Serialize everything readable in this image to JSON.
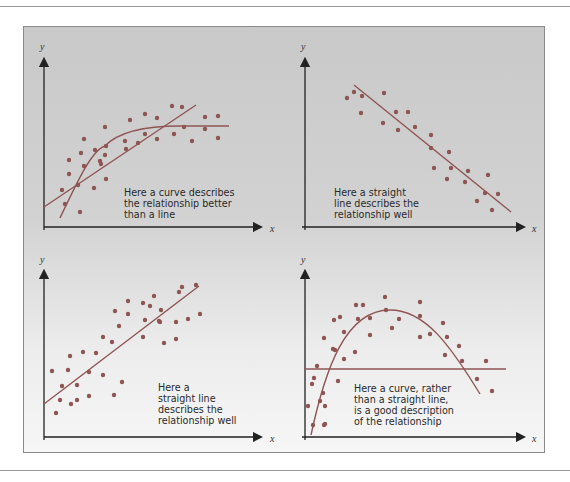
{
  "chart_data": [
    {
      "type": "scatter",
      "panel": "top-left",
      "xlabel": "x",
      "ylabel": "y",
      "annotation": "Here a curve describes the relationship better than a line",
      "fits": [
        "curve (saturating)",
        "straight line"
      ],
      "points": [
        [
          62,
          190
        ],
        [
          65,
          204
        ],
        [
          69,
          160
        ],
        [
          69,
          174
        ],
        [
          78,
          185
        ],
        [
          81,
          153
        ],
        [
          80,
          212
        ],
        [
          84,
          139
        ],
        [
          84,
          166
        ],
        [
          94,
          188
        ],
        [
          95,
          150
        ],
        [
          101,
          164
        ],
        [
          100,
          161
        ],
        [
          105,
          127
        ],
        [
          105,
          155
        ],
        [
          106,
          179
        ],
        [
          106,
          146
        ],
        [
          125,
          141
        ],
        [
          126,
          149
        ],
        [
          130,
          120
        ],
        [
          138,
          143
        ],
        [
          145,
          114
        ],
        [
          145,
          134
        ],
        [
          157,
          118
        ],
        [
          157,
          139
        ],
        [
          172,
          106
        ],
        [
          174,
          134
        ],
        [
          182,
          107
        ],
        [
          184,
          127
        ],
        [
          192,
          141
        ],
        [
          205,
          117
        ],
        [
          205,
          129
        ],
        [
          218,
          116
        ],
        [
          218,
          138
        ]
      ],
      "labels_annotation": [
        "Here a curve describes",
        "the relationship better",
        "than a line"
      ]
    },
    {
      "type": "scatter",
      "panel": "top-right",
      "xlabel": "x",
      "ylabel": "y",
      "annotation": "Here a straight line describes the relationship well",
      "fits": [
        "straight line (negative slope)"
      ],
      "points": [
        [
          347,
          98
        ],
        [
          354,
          92
        ],
        [
          362,
          96
        ],
        [
          361,
          113
        ],
        [
          383,
          123
        ],
        [
          384,
          93
        ],
        [
          396,
          112
        ],
        [
          398,
          130
        ],
        [
          408,
          112
        ],
        [
          415,
          127
        ],
        [
          431,
          135
        ],
        [
          431,
          148
        ],
        [
          434,
          168
        ],
        [
          449,
          152
        ],
        [
          451,
          168
        ],
        [
          447,
          179
        ],
        [
          468,
          171
        ],
        [
          465,
          182
        ],
        [
          488,
          175
        ],
        [
          477,
          201
        ],
        [
          485,
          193
        ],
        [
          492,
          210
        ],
        [
          498,
          194
        ]
      ],
      "labels_annotation": [
        "Here a straight",
        "line describes the",
        "relationship well"
      ]
    },
    {
      "type": "scatter",
      "panel": "bottom-left",
      "xlabel": "x",
      "ylabel": "y",
      "annotation": "Here a straight line describes the relationship well",
      "fits": [
        "straight line (positive slope)"
      ],
      "points": [
        [
          56,
          413
        ],
        [
          60,
          400
        ],
        [
          52,
          371
        ],
        [
          62,
          386
        ],
        [
          68,
          370
        ],
        [
          70,
          356
        ],
        [
          71,
          404
        ],
        [
          77,
          385
        ],
        [
          77,
          400
        ],
        [
          83,
          352
        ],
        [
          89,
          372
        ],
        [
          96,
          353
        ],
        [
          89,
          396
        ],
        [
          103,
          375
        ],
        [
          103,
          337
        ],
        [
          112,
          342
        ],
        [
          115,
          311
        ],
        [
          114,
          395
        ],
        [
          119,
          326
        ],
        [
          122,
          382
        ],
        [
          128,
          314
        ],
        [
          128,
          301
        ],
        [
          143,
          337
        ],
        [
          145,
          320
        ],
        [
          143,
          303
        ],
        [
          150,
          306
        ],
        [
          154,
          296
        ],
        [
          159,
          321
        ],
        [
          161,
          310
        ],
        [
          164,
          343
        ],
        [
          160,
          322
        ],
        [
          176,
          339
        ],
        [
          176,
          322
        ],
        [
          179,
          292
        ],
        [
          182,
          287
        ],
        [
          188,
          319
        ],
        [
          196,
          285
        ],
        [
          200,
          314
        ]
      ],
      "labels_annotation": [
        "Here a",
        "straight line",
        "describes the",
        "relationship well"
      ]
    },
    {
      "type": "scatter",
      "panel": "bottom-right",
      "xlabel": "x",
      "ylabel": "y",
      "annotation": "Here a curve, rather than a straight line, is a good description of the relationship",
      "fits": [
        "curve (inverted U)",
        "horizontal straight line"
      ],
      "points": [
        [
          308,
          406
        ],
        [
          312,
          384
        ],
        [
          313,
          425
        ],
        [
          314,
          378
        ],
        [
          317,
          366
        ],
        [
          320,
          401
        ],
        [
          323,
          393
        ],
        [
          324,
          338
        ],
        [
          324,
          425
        ],
        [
          325,
          406
        ],
        [
          325,
          424
        ],
        [
          333,
          349
        ],
        [
          335,
          350
        ],
        [
          334,
          320
        ],
        [
          338,
          381
        ],
        [
          340,
          317
        ],
        [
          344,
          332
        ],
        [
          344,
          359
        ],
        [
          355,
          352
        ],
        [
          356,
          305
        ],
        [
          358,
          319
        ],
        [
          363,
          305
        ],
        [
          370,
          318
        ],
        [
          370,
          335
        ],
        [
          385,
          297
        ],
        [
          386,
          310
        ],
        [
          392,
          328
        ],
        [
          399,
          319
        ],
        [
          420,
          337
        ],
        [
          420,
          302
        ],
        [
          420,
          316
        ],
        [
          430,
          334
        ],
        [
          443,
          323
        ],
        [
          445,
          355
        ],
        [
          447,
          337
        ],
        [
          459,
          346
        ],
        [
          462,
          361
        ],
        [
          477,
          379
        ],
        [
          486,
          361
        ],
        [
          492,
          391
        ]
      ],
      "labels_annotation": [
        "Here a curve, rather",
        "than a straight line,",
        "is a good description",
        "of the relationship"
      ]
    }
  ],
  "figure": {
    "panels": [
      {
        "name": "top-left",
        "y_label": "y",
        "x_label": "x",
        "caption": [
          "Here a curve describes",
          "the relationship better",
          "than a line"
        ]
      },
      {
        "name": "top-right",
        "y_label": "y",
        "x_label": "x",
        "caption": [
          "Here a straight",
          "line describes the",
          "relationship well"
        ]
      },
      {
        "name": "bottom-left",
        "y_label": "y",
        "x_label": "x",
        "caption": [
          "Here a",
          "straight line",
          "describes the",
          "relationship well"
        ]
      },
      {
        "name": "bottom-right",
        "y_label": "y",
        "x_label": "x",
        "caption": [
          "Here a curve, rather",
          "than a straight line,",
          "is a good description",
          "of the relationship"
        ]
      }
    ],
    "colors": {
      "dots": "#8f5552",
      "lines": "#8f5552",
      "axes": "#222222",
      "background_top": "#c9c9c9",
      "background_bottom": "#f6f6f6"
    }
  }
}
